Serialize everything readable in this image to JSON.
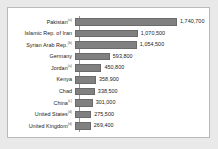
{
  "chart_data": {
    "type": "bar",
    "orientation": "horizontal",
    "title": "",
    "subtitle": "",
    "xlabel": "",
    "ylabel": "",
    "grid": false,
    "legend": false,
    "axis_max": 1740700,
    "value_label_format": "comma-separated integers",
    "bar_color": "#808080",
    "categories": [
      "Pakistan",
      "Islamic Rep. of Iran",
      "Syrian Arab Rep.",
      "Germany",
      "Jordan",
      "Kenya",
      "Chad",
      "China",
      "United States",
      "United Kingdom"
    ],
    "values": [
      1740700,
      1070500,
      1054500,
      593800,
      450800,
      358900,
      338500,
      301000,
      275500,
      269400
    ],
    "value_labels": [
      "1,740,700",
      "1,070,500",
      "1,054,500",
      "593,800",
      "450,800",
      "358,900",
      "338,500",
      "301,000",
      "275,500",
      "269,400"
    ],
    "footnote_markers": [
      "(a)",
      "",
      "(b)",
      "",
      "(a)",
      "",
      "",
      "(c)",
      "(d)",
      "(d)"
    ]
  },
  "rows": [
    {
      "label": "Pakistan",
      "sup": "(a)",
      "value_label": "1,740,700",
      "value": 1740700
    },
    {
      "label": "Islamic Rep. of Iran",
      "sup": "",
      "value_label": "1,070,500",
      "value": 1070500
    },
    {
      "label": "Syrian Arab Rep.",
      "sup": "(b)",
      "value_label": "1,054,500",
      "value": 1054500
    },
    {
      "label": "Germany",
      "sup": "",
      "value_label": "593,800",
      "value": 593800
    },
    {
      "label": "Jordan",
      "sup": "(a)",
      "value_label": "450,800",
      "value": 450800
    },
    {
      "label": "Kenya",
      "sup": "",
      "value_label": "358,900",
      "value": 358900
    },
    {
      "label": "Chad",
      "sup": "",
      "value_label": "338,500",
      "value": 338500
    },
    {
      "label": "China",
      "sup": "(c)",
      "value_label": "301,000",
      "value": 301000
    },
    {
      "label": "United States",
      "sup": "(d)",
      "value_label": "275,500",
      "value": 275500
    },
    {
      "label": "United Kingdom",
      "sup": "(d)",
      "value_label": "269,400",
      "value": 269400
    }
  ]
}
